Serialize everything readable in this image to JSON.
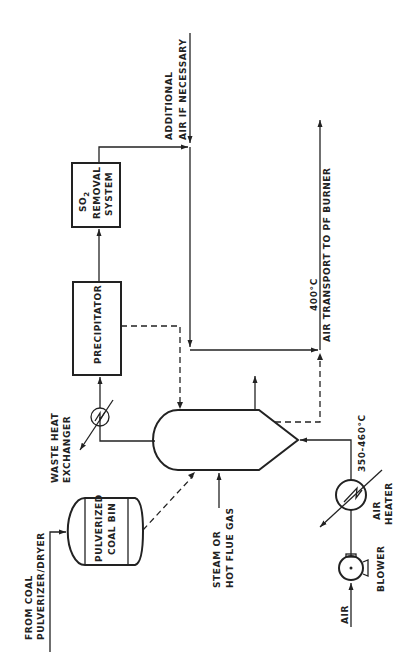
{
  "diagram": {
    "type": "process-flow",
    "orientation": "rotated-90-ccw",
    "units": {
      "precipitator": {
        "label": "PRECIPITATOR"
      },
      "so2_removal": {
        "label_line1": "SO",
        "label_sub": "2",
        "label_line2": "REMOVAL",
        "label_line3": "SYSTEM"
      },
      "coal_bin": {
        "label_line1": "PULVERIZED",
        "label_line2": "COAL BIN"
      },
      "waste_heat_exchanger": {
        "label_line1": "WASTE HEAT",
        "label_line2": "EXCHANGER"
      },
      "air_heater": {
        "label_line1": "AIR",
        "label_line2": "HEATER"
      },
      "blower": {
        "label": "BLOWER"
      },
      "vessel": {
        "label": ""
      }
    },
    "streams": {
      "coal_feed": {
        "label_line1": "FROM COAL",
        "label_line2": "PULVERIZER/DRYER"
      },
      "steam": {
        "label_line1": "STEAM OR",
        "label_line2": "HOT FLUE GAS"
      },
      "air_in": {
        "label": "AIR"
      },
      "air_temp": {
        "label": "350-460°C"
      },
      "additional_air": {
        "label_line1": "ADDITIONAL",
        "label_line2": "AIR IF NECESSARY"
      },
      "product_temp": {
        "label": "400°C"
      },
      "product": {
        "label": "AIR TRANSPORT TO PF BURNER"
      }
    }
  }
}
